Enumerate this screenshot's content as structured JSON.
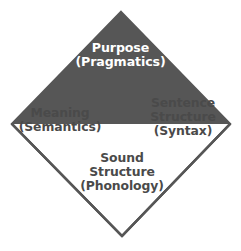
{
  "diagram": {
    "type": "diamond-quadrant-diagram",
    "shape": "diamond",
    "background_color": "#ffffff",
    "outline_color": "#565656",
    "outline_width_px": 2,
    "geometry": {
      "top_vertex": [
        121,
        12
      ],
      "right_vertex": [
        230,
        124
      ],
      "bottom_vertex": [
        122,
        236
      ],
      "left_vertex": [
        12,
        124
      ],
      "center": [
        122,
        124
      ]
    },
    "quadrants": [
      {
        "id": "top",
        "fill_color": "#565656",
        "text_color": "#ffffff",
        "lines": [
          "Purpose",
          "(Pragmatics)"
        ],
        "title": "Purpose",
        "subtitle": "(Pragmatics)"
      },
      {
        "id": "left",
        "fill_color": "#ffffff",
        "text_color": "#4a4a4a",
        "lines": [
          "Meaning",
          "(Semantics)"
        ],
        "title": "Meaning",
        "subtitle": "(Semantics)"
      },
      {
        "id": "right",
        "fill_color": "#ffffff",
        "text_color": "#4a4a4a",
        "lines": [
          "Sentence",
          "Structure",
          "(Syntax)"
        ],
        "title": "Sentence Structure",
        "subtitle": "(Syntax)"
      },
      {
        "id": "bottom",
        "fill_color": "#ffffff",
        "text_color": "#4a4a4a",
        "lines": [
          "Sound",
          "Structure",
          "(Phonology)"
        ],
        "title": "Sound Structure",
        "subtitle": "(Phonology)"
      }
    ]
  }
}
